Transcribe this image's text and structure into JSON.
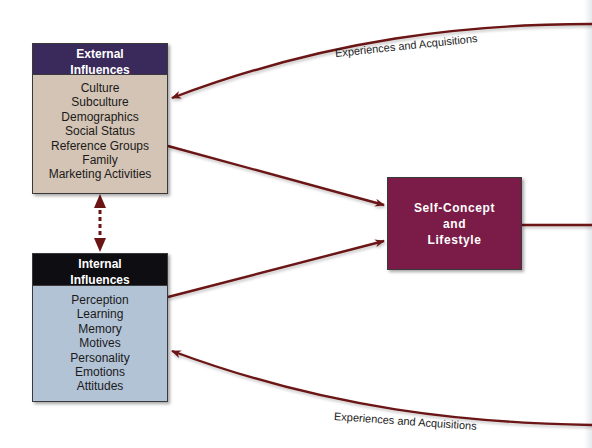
{
  "diagram": {
    "colors": {
      "arrow": "#6b1414",
      "external_header": "#3a2a5c",
      "external_body": "#d4c4b5",
      "internal_header": "#0d0d12",
      "internal_body": "#b3c3d6",
      "self_concept": "#7a1c47"
    },
    "external_influences": {
      "title_line1": "External",
      "title_line2": "Influences",
      "items": [
        "Culture",
        "Subculture",
        "Demographics",
        "Social Status",
        "Reference Groups",
        "Family",
        "Marketing Activities"
      ]
    },
    "internal_influences": {
      "title_line1": "Internal",
      "title_line2": "Influences",
      "items": [
        "Perception",
        "Learning",
        "Memory",
        "Motives",
        "Personality",
        "Emotions",
        "Attitudes"
      ]
    },
    "self_concept": {
      "line1": "Self-Concept",
      "line2": "and",
      "line3": "Lifestyle"
    },
    "edge_labels": {
      "top": "Experiences and Acquisitions",
      "bottom": "Experiences and Acquisitions"
    },
    "edges": [
      {
        "from": "offscreen-right",
        "to": "external-influences",
        "label": "Experiences and Acquisitions"
      },
      {
        "from": "external-influences",
        "to": "self-concept-and-lifestyle"
      },
      {
        "from": "internal-influences",
        "to": "self-concept-and-lifestyle"
      },
      {
        "from": "external-influences",
        "to": "internal-influences",
        "style": "dashed-bidirectional"
      },
      {
        "from": "self-concept-and-lifestyle",
        "to": "offscreen-right"
      },
      {
        "from": "offscreen-right",
        "to": "internal-influences",
        "label": "Experiences and Acquisitions"
      }
    ]
  }
}
